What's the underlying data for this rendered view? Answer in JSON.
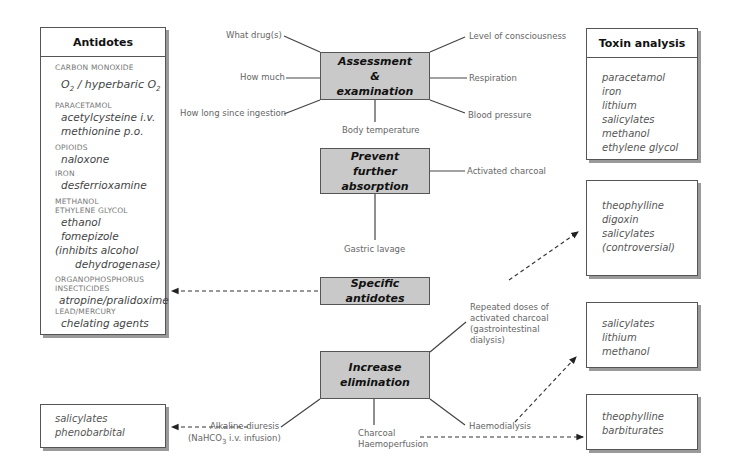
{
  "antidotes": {
    "title": "Antidotes",
    "groups": [
      {
        "toxin": "CARBON MONOXIDE",
        "antidotes": [
          "O2 / hyperbaric O2"
        ]
      },
      {
        "toxin": "PARACETAMOL",
        "antidotes": [
          "acetylcysteine i.v.",
          "methionine p.o."
        ]
      },
      {
        "toxin": "OPIOIDS",
        "antidotes": [
          "naloxone"
        ]
      },
      {
        "toxin": "IRON",
        "antidotes": [
          "desferrioxamine"
        ]
      },
      {
        "toxin": "METHANOL",
        "toxin2": "ETHYLENE GLYCOL",
        "antidotes": [
          "ethanol",
          "fomepizole",
          "(inhibits alcohol",
          "dehydrogenase)"
        ]
      },
      {
        "toxin": "ORGANOPHOSPHORUS",
        "toxin2": "INSECTICIDES",
        "antidotes": [
          "atropine/pralidoxime"
        ]
      },
      {
        "toxin": "LEAD/MERCURY",
        "antidotes": [
          "chelating agents"
        ]
      }
    ]
  },
  "toxin_analysis": {
    "title": "Toxin analysis",
    "items": [
      "paracetamol",
      "iron",
      "lithium",
      "salicylates",
      "methanol",
      "ethylene glycol"
    ]
  },
  "central_boxes": {
    "assessment": "Assessment & examination",
    "prevent": "Prevent further absorption",
    "specific": "Specific antidotes",
    "increase": "Increase elimination"
  },
  "assessment_labels": {
    "what_drugs": "What drug(s)",
    "how_much": "How much",
    "how_long": "How long since ingestion",
    "body_temp": "Body temperature",
    "consciousness": "Level of consciousness",
    "respiration": "Respiration",
    "blood_pressure": "Blood pressure"
  },
  "prevent_labels": {
    "charcoal": "Activated charcoal",
    "lavage": "Gastric lavage"
  },
  "elimination_labels": {
    "repeated": [
      "Repeated doses of",
      "activated charcoal",
      "(gastrointestinal",
      "dialysis)"
    ],
    "alkaline": "Alkaline diuresis",
    "alkaline_sub": "(NaHCO3 i.v. infusion)",
    "charcoal_haemo": [
      "Charcoal",
      "Haemoperfusion"
    ],
    "haemodialysis": "Haemodialysis"
  },
  "result_boxes": {
    "repeated_charcoal": [
      "theophylline",
      "digoxin",
      "salicylates",
      "(controversial)"
    ],
    "haemodialysis": [
      "salicylates",
      "lithium",
      "methanol"
    ],
    "haemoperfusion": [
      "theophylline",
      "barbiturates"
    ],
    "alkaline": [
      "salicylates",
      "phenobarbital"
    ]
  }
}
